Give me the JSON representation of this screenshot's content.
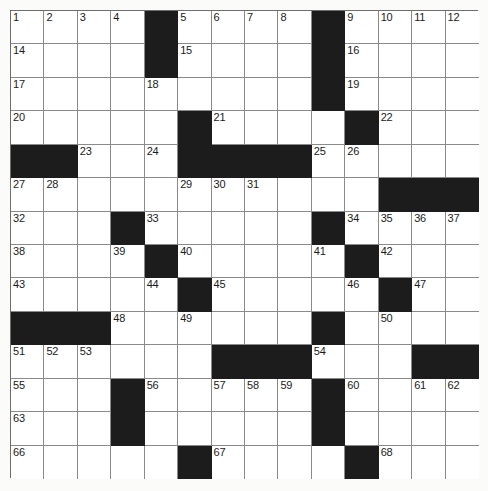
{
  "puzzle": {
    "title": "Crossword Grid",
    "type": "crossword",
    "columns": 14,
    "rows": 14,
    "cell_size": 33.43,
    "colors": {
      "block": "#1c1c1c",
      "cell": "#ffffff",
      "grid_line": "#8a8a8a",
      "border": "#6d6d6d",
      "number_text": "#1a1a1a",
      "page_background": "#fbfbfa"
    },
    "block_count": 38,
    "numbered_count": 71,
    "blocks": [
      [
        0,
        4
      ],
      [
        0,
        9
      ],
      [
        1,
        4
      ],
      [
        1,
        9
      ],
      [
        2,
        9
      ],
      [
        3,
        5
      ],
      [
        3,
        10
      ],
      [
        4,
        0
      ],
      [
        4,
        1
      ],
      [
        4,
        5
      ],
      [
        4,
        6
      ],
      [
        4,
        7
      ],
      [
        4,
        8
      ],
      [
        5,
        11
      ],
      [
        5,
        12
      ],
      [
        5,
        13
      ],
      [
        6,
        3
      ],
      [
        6,
        9
      ],
      [
        7,
        4
      ],
      [
        7,
        10
      ],
      [
        8,
        5
      ],
      [
        8,
        11
      ],
      [
        9,
        0
      ],
      [
        9,
        1
      ],
      [
        9,
        2
      ],
      [
        9,
        9
      ],
      [
        10,
        6
      ],
      [
        10,
        7
      ],
      [
        10,
        8
      ],
      [
        10,
        12
      ],
      [
        10,
        13
      ],
      [
        11,
        3
      ],
      [
        11,
        9
      ],
      [
        12,
        3
      ],
      [
        12,
        9
      ],
      [
        13,
        5
      ],
      [
        13,
        10
      ]
    ],
    "numbers": [
      {
        "r": 0,
        "c": 0,
        "n": "1"
      },
      {
        "r": 0,
        "c": 1,
        "n": "2"
      },
      {
        "r": 0,
        "c": 2,
        "n": "3"
      },
      {
        "r": 0,
        "c": 3,
        "n": "4"
      },
      {
        "r": 0,
        "c": 5,
        "n": "5"
      },
      {
        "r": 0,
        "c": 6,
        "n": "6"
      },
      {
        "r": 0,
        "c": 7,
        "n": "7"
      },
      {
        "r": 0,
        "c": 8,
        "n": "8"
      },
      {
        "r": 0,
        "c": 10,
        "n": "9"
      },
      {
        "r": 0,
        "c": 11,
        "n": "10"
      },
      {
        "r": 0,
        "c": 12,
        "n": "11"
      },
      {
        "r": 0,
        "c": 13,
        "n": "12"
      },
      {
        "r": 0,
        "c": 14,
        "n": "13"
      },
      {
        "r": 1,
        "c": 0,
        "n": "14"
      },
      {
        "r": 1,
        "c": 5,
        "n": "15"
      },
      {
        "r": 1,
        "c": 10,
        "n": "16"
      },
      {
        "r": 2,
        "c": 0,
        "n": "17"
      },
      {
        "r": 2,
        "c": 4,
        "n": "18"
      },
      {
        "r": 2,
        "c": 10,
        "n": "19"
      },
      {
        "r": 3,
        "c": 0,
        "n": "20"
      },
      {
        "r": 3,
        "c": 6,
        "n": "21"
      },
      {
        "r": 3,
        "c": 11,
        "n": "22"
      },
      {
        "r": 4,
        "c": 2,
        "n": "23"
      },
      {
        "r": 4,
        "c": 4,
        "n": "24"
      },
      {
        "r": 4,
        "c": 9,
        "n": "25"
      },
      {
        "r": 4,
        "c": 10,
        "n": "26"
      },
      {
        "r": 5,
        "c": 0,
        "n": "27"
      },
      {
        "r": 5,
        "c": 1,
        "n": "28"
      },
      {
        "r": 5,
        "c": 5,
        "n": "29"
      },
      {
        "r": 5,
        "c": 6,
        "n": "30"
      },
      {
        "r": 5,
        "c": 7,
        "n": "31"
      },
      {
        "r": 6,
        "c": 0,
        "n": "32"
      },
      {
        "r": 6,
        "c": 4,
        "n": "33"
      },
      {
        "r": 6,
        "c": 10,
        "n": "34"
      },
      {
        "r": 6,
        "c": 11,
        "n": "35"
      },
      {
        "r": 6,
        "c": 12,
        "n": "36"
      },
      {
        "r": 6,
        "c": 13,
        "n": "37"
      },
      {
        "r": 7,
        "c": 0,
        "n": "38"
      },
      {
        "r": 7,
        "c": 3,
        "n": "39"
      },
      {
        "r": 7,
        "c": 5,
        "n": "40"
      },
      {
        "r": 7,
        "c": 9,
        "n": "41"
      },
      {
        "r": 7,
        "c": 11,
        "n": "42"
      },
      {
        "r": 8,
        "c": 0,
        "n": "43"
      },
      {
        "r": 8,
        "c": 4,
        "n": "44"
      },
      {
        "r": 8,
        "c": 6,
        "n": "45"
      },
      {
        "r": 8,
        "c": 10,
        "n": "46"
      },
      {
        "r": 8,
        "c": 12,
        "n": "47"
      },
      {
        "r": 9,
        "c": 3,
        "n": "48"
      },
      {
        "r": 9,
        "c": 5,
        "n": "49"
      },
      {
        "r": 9,
        "c": 11,
        "n": "50"
      },
      {
        "r": 10,
        "c": 0,
        "n": "51"
      },
      {
        "r": 10,
        "c": 1,
        "n": "52"
      },
      {
        "r": 10,
        "c": 2,
        "n": "53"
      },
      {
        "r": 10,
        "c": 9,
        "n": "54"
      },
      {
        "r": 11,
        "c": 0,
        "n": "55"
      },
      {
        "r": 11,
        "c": 4,
        "n": "56"
      },
      {
        "r": 11,
        "c": 6,
        "n": "57"
      },
      {
        "r": 11,
        "c": 7,
        "n": "58"
      },
      {
        "r": 11,
        "c": 8,
        "n": "59"
      },
      {
        "r": 11,
        "c": 10,
        "n": "60"
      },
      {
        "r": 11,
        "c": 12,
        "n": "61"
      },
      {
        "r": 11,
        "c": 13,
        "n": "62"
      },
      {
        "r": 12,
        "c": 0,
        "n": "63"
      },
      {
        "r": 12,
        "c": 3,
        "n": "64"
      },
      {
        "r": 12,
        "c": 9,
        "n": "65"
      },
      {
        "r": 13,
        "c": 0,
        "n": "66"
      },
      {
        "r": 13,
        "c": 6,
        "n": "67"
      },
      {
        "r": 13,
        "c": 11,
        "n": "68"
      }
    ],
    "numbers_extra": [
      {
        "r": 14,
        "c": 0,
        "n": "69"
      },
      {
        "r": 14,
        "c": 6,
        "n": "70"
      },
      {
        "r": 14,
        "c": 11,
        "n": "71"
      }
    ]
  }
}
